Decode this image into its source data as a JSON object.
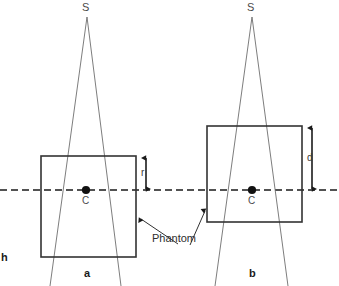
{
  "figure": {
    "kind": "radiography-geometry-diagram",
    "width": 339,
    "height": 286,
    "background_color": "#ffffff",
    "stroke_color": "#333333",
    "beam_color": "#6e6e6e",
    "axis_color": "#1a1a1a",
    "figure_mark": "h"
  },
  "axis": {
    "name": "central-horizontal-dashed-axis",
    "y": 190,
    "style": "dashed"
  },
  "panel_a": {
    "id": "a",
    "panel_label": "a",
    "source_label": "S",
    "center_label": "C",
    "dimension_label": "r",
    "source": {
      "x": 87,
      "y": 17
    },
    "center": {
      "x": 86,
      "y": 190
    },
    "phantom_rect": {
      "x": 41,
      "y": 156,
      "width": 95,
      "height": 101
    },
    "beam_left_bottom": {
      "x": 50,
      "y": 286
    },
    "beam_right_bottom": {
      "x": 121,
      "y": 286
    },
    "dimension_arrow": {
      "x": 146,
      "y_top": 157,
      "y_bottom": 189
    }
  },
  "panel_b": {
    "id": "b",
    "panel_label": "b",
    "source_label": "S",
    "center_label": "C",
    "dimension_label": "d",
    "source": {
      "x": 252,
      "y": 17
    },
    "center": {
      "x": 252,
      "y": 190
    },
    "phantom_rect": {
      "x": 207,
      "y": 126,
      "width": 95,
      "height": 96
    },
    "beam_left_bottom": {
      "x": 215,
      "y": 286
    },
    "beam_right_bottom": {
      "x": 288,
      "y": 286
    },
    "dimension_arrow": {
      "x": 312,
      "y_top": 127,
      "y_bottom": 189
    }
  },
  "annotation": {
    "phantom_label": "Phantom",
    "phantom_label_x": 152,
    "phantom_label_y": 233
  }
}
